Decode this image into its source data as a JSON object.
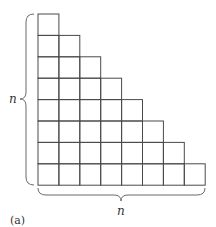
{
  "diagram": {
    "type": "staircase-grid",
    "rows": 8,
    "row_lengths": [
      1,
      2,
      3,
      4,
      5,
      6,
      7,
      8
    ],
    "labels": {
      "left_brace": "n",
      "bottom_brace": "n",
      "caption": "(a)"
    },
    "colors": {
      "grid_line": "#4a4a4a",
      "brace": "#6a6a6a",
      "background": "#ffffff"
    }
  }
}
